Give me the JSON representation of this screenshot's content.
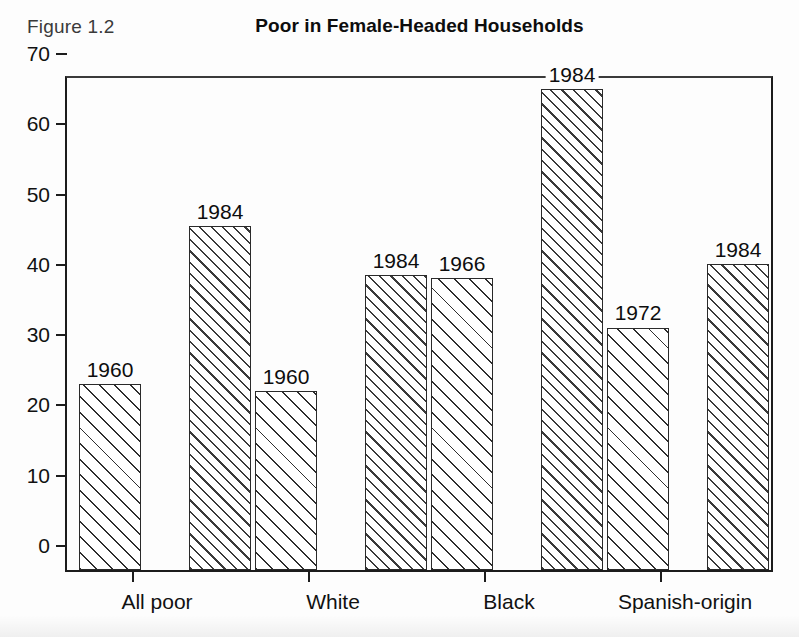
{
  "figure": {
    "number_label": "Figure 1.2",
    "title": "Poor in Female-Headed Households"
  },
  "chart_data": {
    "type": "bar",
    "title": "Poor in Female-Headed Households",
    "xlabel": "",
    "ylabel": "",
    "ylim": [
      0,
      70
    ],
    "yticks": [
      "0",
      "10",
      "20",
      "30",
      "40",
      "50",
      "60",
      "70"
    ],
    "ytick_values": [
      0,
      10,
      20,
      30,
      40,
      50,
      60,
      70
    ],
    "grid": false,
    "legend": "none",
    "categories": [
      "All poor",
      "White",
      "Black",
      "Spanish-origin"
    ],
    "bars": [
      {
        "category": "All poor",
        "label": "1960",
        "value": 26.5
      },
      {
        "category": "All poor",
        "label": "1984",
        "value": 49.0
      },
      {
        "category": "White",
        "label": "1960",
        "value": 25.5
      },
      {
        "category": "White",
        "label": "1984",
        "value": 42.0
      },
      {
        "category": "Black",
        "label": "1966",
        "value": 41.5
      },
      {
        "category": "Black",
        "label": "1984",
        "value": 68.5
      },
      {
        "category": "Spanish-origin",
        "label": "1972",
        "value": 34.5
      },
      {
        "category": "Spanish-origin",
        "label": "1984",
        "value": 43.5
      }
    ],
    "series": [
      {
        "name": "earlier year",
        "values": [
          26.5,
          25.5,
          41.5,
          34.5
        ],
        "labels": [
          "1960",
          "1960",
          "1966",
          "1972"
        ]
      },
      {
        "name": "1984",
        "values": [
          49.0,
          42.0,
          68.5,
          43.5
        ],
        "labels": [
          "1984",
          "1984",
          "1984",
          "1984"
        ]
      }
    ]
  },
  "colors": {
    "axis": "#1c1c1c",
    "bar_outline": "#2a2a2a",
    "hatch": "#2e2e2e",
    "background": "#fdfdfd",
    "text": "#111111"
  }
}
